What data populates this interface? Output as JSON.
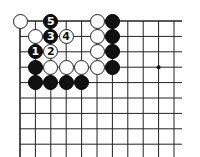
{
  "board": {
    "origin_x": 20,
    "origin_y": 21,
    "spacing": 15.4,
    "cols": 11,
    "rows": 9,
    "star_points": [
      [
        9,
        3
      ]
    ],
    "stones": [
      {
        "col": 0,
        "row": 0,
        "color": "white",
        "label": ""
      },
      {
        "col": 2,
        "row": 0,
        "color": "black",
        "label": "5"
      },
      {
        "col": 5,
        "row": 0,
        "color": "white",
        "label": ""
      },
      {
        "col": 6,
        "row": 0,
        "color": "black",
        "label": ""
      },
      {
        "col": 1,
        "row": 1,
        "color": "white",
        "label": ""
      },
      {
        "col": 2,
        "row": 1,
        "color": "black",
        "label": "3"
      },
      {
        "col": 3,
        "row": 1,
        "color": "white",
        "label": "4"
      },
      {
        "col": 5,
        "row": 1,
        "color": "white",
        "label": ""
      },
      {
        "col": 6,
        "row": 1,
        "color": "black",
        "label": ""
      },
      {
        "col": 1,
        "row": 2,
        "color": "black",
        "label": "1"
      },
      {
        "col": 2,
        "row": 2,
        "color": "white",
        "label": "2"
      },
      {
        "col": 5,
        "row": 2,
        "color": "white",
        "label": ""
      },
      {
        "col": 6,
        "row": 2,
        "color": "black",
        "label": ""
      },
      {
        "col": 1,
        "row": 3,
        "color": "black",
        "label": ""
      },
      {
        "col": 2,
        "row": 3,
        "color": "white",
        "label": ""
      },
      {
        "col": 3,
        "row": 3,
        "color": "white",
        "label": ""
      },
      {
        "col": 4,
        "row": 3,
        "color": "white",
        "label": ""
      },
      {
        "col": 5,
        "row": 3,
        "color": "white",
        "label": ""
      },
      {
        "col": 6,
        "row": 3,
        "color": "black",
        "label": ""
      },
      {
        "col": 1,
        "row": 4,
        "color": "black",
        "label": ""
      },
      {
        "col": 2,
        "row": 4,
        "color": "black",
        "label": ""
      },
      {
        "col": 3,
        "row": 4,
        "color": "black",
        "label": ""
      },
      {
        "col": 4,
        "row": 4,
        "color": "black",
        "label": ""
      }
    ]
  },
  "colors": {
    "line": "#222222",
    "black": "#111111",
    "white": "#ffffff"
  }
}
